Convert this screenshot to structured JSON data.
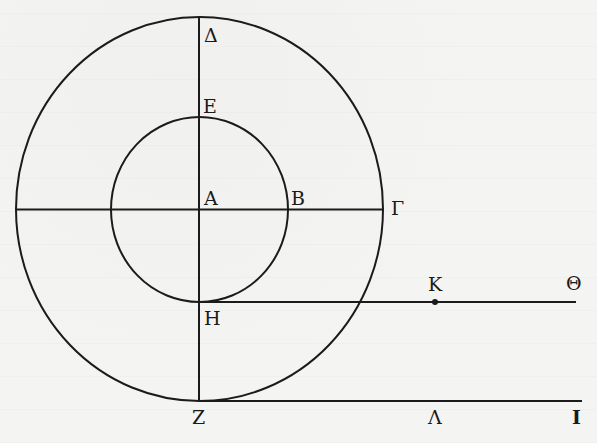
{
  "figure": {
    "type": "geometric-diagram",
    "colors": {
      "ink": "#1b1b1b",
      "paper": "#f4f4f2"
    },
    "labels": {
      "center": "A",
      "inner_right": "B",
      "outer_right": "Γ",
      "outer_top": "Δ",
      "inner_top": "E",
      "outer_bottom": "Z",
      "inner_bottom": "H",
      "upper_line_end": "Θ",
      "upper_line_point": "K",
      "lower_line_point": "Λ",
      "lower_line_end": "I"
    }
  }
}
